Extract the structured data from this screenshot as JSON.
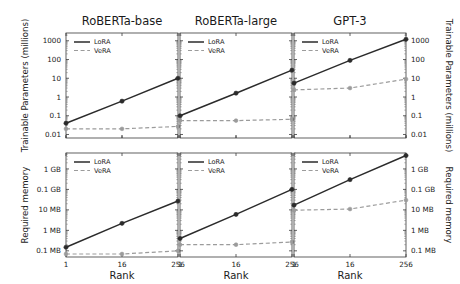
{
  "figure": {
    "column_titles": [
      "RoBERTa-base",
      "RoBERTa-large",
      "GPT-3"
    ],
    "row_ylabels": [
      "Trainable Parameters (millions)",
      "Required memory"
    ],
    "xlabel": "Rank",
    "legend": {
      "lora": "LoRA",
      "vera": "VeRA"
    },
    "colors": {
      "lora": "#2b2b2b",
      "vera": "#9b9b9b",
      "axis": "#3a3a3a",
      "background": "#ffffff"
    }
  },
  "chart_data": [
    {
      "type": "line",
      "panel": "top-left",
      "title": "RoBERTa-base",
      "xlabel": "Rank",
      "ylabel": "Trainable Parameters (millions)",
      "xscale": "log",
      "yscale": "log",
      "x": [
        1,
        16,
        256
      ],
      "xtick_labels": [
        "1",
        "16",
        "256"
      ],
      "ytick_labels": [
        "0.01",
        "0.1",
        "1",
        "10",
        "100",
        "1000"
      ],
      "ytick_values": [
        0.01,
        0.1,
        1,
        10,
        100,
        1000
      ],
      "ylim": [
        0.0065,
        2600
      ],
      "grid": false,
      "legend_position": "upper left",
      "series": [
        {
          "name": "LoRA",
          "values": [
            0.04,
            0.6,
            10
          ]
        },
        {
          "name": "VeRA",
          "values": [
            0.02,
            0.02,
            0.027
          ]
        }
      ]
    },
    {
      "type": "line",
      "panel": "top-middle",
      "title": "RoBERTa-large",
      "xlabel": "Rank",
      "ylabel": "Trainable Parameters (millions)",
      "xscale": "log",
      "yscale": "log",
      "x": [
        1,
        16,
        256
      ],
      "xtick_labels": [
        "1",
        "16",
        "256"
      ],
      "ytick_labels": [
        "0.01",
        "0.1",
        "1",
        "10",
        "100",
        "1000"
      ],
      "ytick_values": [
        0.01,
        0.1,
        1,
        10,
        100,
        1000
      ],
      "ylim": [
        0.0065,
        2600
      ],
      "grid": false,
      "legend_position": "upper left",
      "series": [
        {
          "name": "LoRA",
          "values": [
            0.1,
            1.6,
            27
          ]
        },
        {
          "name": "VeRA",
          "values": [
            0.055,
            0.055,
            0.065
          ]
        }
      ]
    },
    {
      "type": "line",
      "panel": "top-right",
      "title": "GPT-3",
      "xlabel": "Rank",
      "ylabel": "Trainable Parameters (millions)",
      "xscale": "log",
      "yscale": "log",
      "x": [
        1,
        16,
        256
      ],
      "xtick_labels": [
        "1",
        "16",
        "256"
      ],
      "ytick_labels": [
        "0.01",
        "0.1",
        "1",
        "10",
        "100",
        "1000"
      ],
      "ytick_values": [
        0.01,
        0.1,
        1,
        10,
        100,
        1000
      ],
      "ylim": [
        0.0065,
        2600
      ],
      "grid": false,
      "legend_position": "upper left",
      "series": [
        {
          "name": "LoRA",
          "values": [
            5.5,
            90,
            1200
          ]
        },
        {
          "name": "VeRA",
          "values": [
            2.4,
            3.0,
            9.0
          ]
        }
      ]
    },
    {
      "type": "line",
      "panel": "bottom-left",
      "title": "RoBERTa-base",
      "xlabel": "Rank",
      "ylabel": "Required memory",
      "xscale": "log",
      "yscale": "log",
      "x": [
        1,
        16,
        256
      ],
      "xtick_labels": [
        "1",
        "16",
        "256"
      ],
      "ytick_labels": [
        "0.1 MB",
        "1 MB",
        "10 MB",
        "0.1 GB",
        "1 GB"
      ],
      "ytick_values_mb": [
        0.1,
        1,
        10,
        100,
        1000
      ],
      "ylim_mb": [
        0.05,
        6000
      ],
      "grid": false,
      "legend_position": "upper left",
      "series": [
        {
          "name": "LoRA",
          "values_mb": [
            0.15,
            2.2,
            27
          ]
        },
        {
          "name": "VeRA",
          "values_mb": [
            0.07,
            0.07,
            0.1
          ]
        }
      ]
    },
    {
      "type": "line",
      "panel": "bottom-middle",
      "title": "RoBERTa-large",
      "xlabel": "Rank",
      "ylabel": "Required memory",
      "xscale": "log",
      "yscale": "log",
      "x": [
        1,
        16,
        256
      ],
      "xtick_labels": [
        "1",
        "16",
        "256"
      ],
      "ytick_labels": [
        "0.1 MB",
        "1 MB",
        "10 MB",
        "0.1 GB",
        "1 GB"
      ],
      "ytick_values_mb": [
        0.1,
        1,
        10,
        100,
        1000
      ],
      "ylim_mb": [
        0.05,
        6000
      ],
      "grid": false,
      "legend_position": "upper left",
      "series": [
        {
          "name": "LoRA",
          "values_mb": [
            0.4,
            6,
            100
          ]
        },
        {
          "name": "VeRA",
          "values_mb": [
            0.2,
            0.2,
            0.27
          ]
        }
      ]
    },
    {
      "type": "line",
      "panel": "bottom-right",
      "title": "GPT-3",
      "xlabel": "Rank",
      "ylabel": "Required memory",
      "xscale": "log",
      "yscale": "log",
      "x": [
        1,
        16,
        256
      ],
      "xtick_labels": [
        "1",
        "16",
        "256"
      ],
      "ytick_labels": [
        "0.1 MB",
        "1 MB",
        "10 MB",
        "0.1 GB",
        "1 GB"
      ],
      "ytick_values_mb": [
        0.1,
        1,
        10,
        100,
        1000
      ],
      "ylim_mb": [
        0.05,
        6000
      ],
      "grid": false,
      "legend_position": "upper left",
      "series": [
        {
          "name": "LoRA",
          "values_mb": [
            17,
            300,
            4500
          ]
        },
        {
          "name": "VeRA",
          "values_mb": [
            9.6,
            11,
            30
          ]
        }
      ]
    }
  ]
}
